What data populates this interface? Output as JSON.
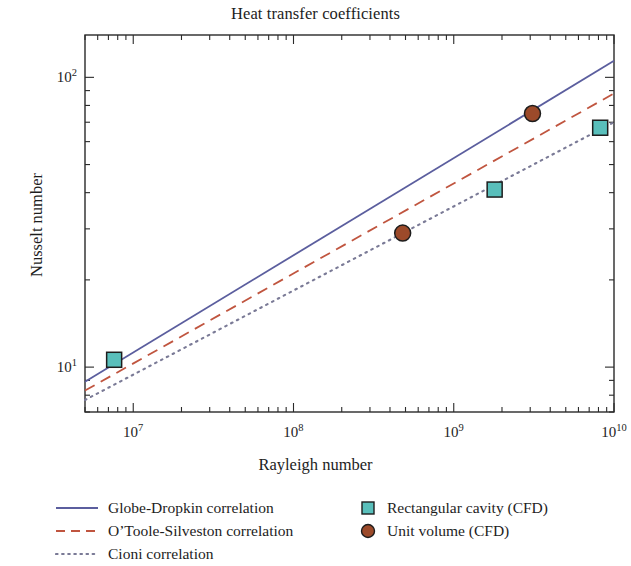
{
  "chart_data": {
    "type": "line",
    "title": "Heat transfer coefficients",
    "xlabel": "Rayleigh number",
    "ylabel": "Nusselt number",
    "xscale": "log",
    "yscale": "log",
    "xlim": [
      5000000.0,
      10000000000.0
    ],
    "ylim": [
      7.0,
      140
    ],
    "grid": false,
    "legend_position": "below",
    "xticks": [
      {
        "value": 10000000.0,
        "label": "10",
        "exp": "7"
      },
      {
        "value": 100000000.0,
        "label": "10",
        "exp": "8"
      },
      {
        "value": 1000000000.0,
        "label": "10",
        "exp": "9"
      },
      {
        "value": 10000000000.0,
        "label": "10",
        "exp": "10"
      }
    ],
    "yticks": [
      {
        "value": 10,
        "label": "10",
        "exp": "1"
      },
      {
        "value": 100,
        "label": "10",
        "exp": "2"
      }
    ],
    "series": [
      {
        "name": "Globe-Dropkin correlation",
        "kind": "line",
        "style": "solid",
        "color": "#5b5e9e",
        "x": [
          5000000.0,
          10000000000.0
        ],
        "y": [
          8.9,
          114.0
        ]
      },
      {
        "name": "O'Toole-Silveston correlation",
        "kind": "line",
        "style": "dashed",
        "color": "#c0553f",
        "x": [
          5000000.0,
          10000000000.0
        ],
        "y": [
          8.3,
          88.0
        ]
      },
      {
        "name": "Cioni correlation",
        "kind": "line",
        "style": "dotted",
        "color": "#7a7a96",
        "x": [
          5000000.0,
          10000000000.0
        ],
        "y": [
          7.7,
          70.0
        ]
      },
      {
        "name": "Rectangular cavity (CFD)",
        "kind": "scatter",
        "marker": "square",
        "color": "#59bfbb",
        "edge": "#1d1d1d",
        "x": [
          7600000.0,
          1800000000.0,
          8200000000.0
        ],
        "y": [
          10.6,
          41.0,
          67.0
        ]
      },
      {
        "name": "Unit volume (CFD)",
        "kind": "scatter",
        "marker": "circle",
        "color": "#9c4a2a",
        "edge": "#1d1d1d",
        "x": [
          480000000.0,
          3100000000.0
        ],
        "y": [
          29.0,
          75.0
        ]
      }
    ]
  },
  "legend": {
    "rows": [
      {
        "left": {
          "type": "line",
          "style": "solid",
          "label": "Globe-Dropkin correlation"
        },
        "right": {
          "type": "marker",
          "shape": "square",
          "label": "Rectangular cavity (CFD)"
        }
      },
      {
        "left": {
          "type": "line",
          "style": "dashed",
          "label": "O’Toole-Silveston correlation"
        },
        "right": {
          "type": "marker",
          "shape": "circle",
          "label": "Unit volume (CFD)"
        }
      },
      {
        "left": {
          "type": "line",
          "style": "dotted",
          "label": "Cioni correlation"
        },
        "right": null
      }
    ]
  },
  "colors": {
    "solid_line": "#5b5e9e",
    "dashed_line": "#c0553f",
    "dotted_line": "#7a7a96",
    "square_marker": "#59bfbb",
    "circle_marker": "#9c4a2a",
    "axis": "#2a2a2a",
    "text": "#1d1d1d",
    "background": "#ffffff"
  }
}
